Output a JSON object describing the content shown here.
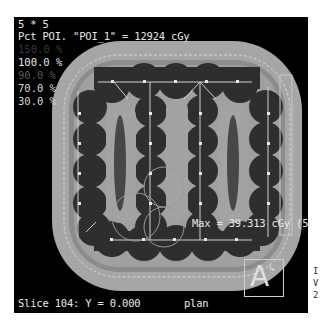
{
  "header": {
    "grid_label": "5 * 5",
    "poi_line": "Pct POI. \"POI_1\" = 12924 cGy"
  },
  "legend": {
    "levels": [
      {
        "label": "150.0 %",
        "color": "#3a3a3a"
      },
      {
        "label": "100.0 %",
        "color": "#e8e8e8"
      },
      {
        "label": "90.0 %",
        "color": "#5a5a5a"
      },
      {
        "label": "70.0 %",
        "color": "#d8d8d8"
      },
      {
        "label": "30.0 %",
        "color": "#d8d8d8"
      }
    ]
  },
  "overlay": {
    "max_label": "Max = 39.313 cGy (5"
  },
  "footer": {
    "slice_label": "Slice 104: Y = 0.000",
    "plan_label": "plan"
  },
  "orientation": {
    "letter": "A",
    "arrow": "↳"
  },
  "side_fragments": [
    "I",
    "V",
    "2"
  ],
  "colors": {
    "background": "#000000",
    "outer_body": "#a8a8a8",
    "inner_ring": "#8c8c8c",
    "high_dose": "#2e2e2e",
    "mid_dose": "#a0a0a0",
    "core": "#4a4a4a",
    "grid_lines": "#d0d0d0"
  }
}
